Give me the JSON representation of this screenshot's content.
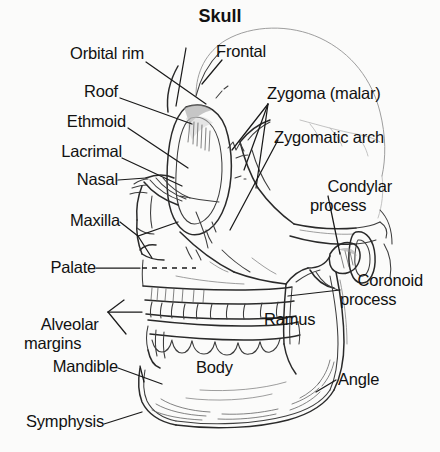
{
  "figure": {
    "title": "Skull",
    "type": "anatomical-diagram",
    "background_color": "#fbfbfa",
    "ink_color": "#2a2a2a"
  },
  "labels": {
    "orbital_rim": "Orbital rim",
    "frontal": "Frontal",
    "roof": "Roof",
    "zygoma_malar": "Zygoma (malar)",
    "ethmoid": "Ethmoid",
    "zygomatic_arch": "Zygomatic arch",
    "lacrimal": "Lacrimal",
    "condylar_process": "Condylar\nprocess",
    "nasal": "Nasal",
    "maxilla": "Maxilla",
    "palate": "Palate",
    "coronoid_process": "Coronoid\nprocess",
    "alveolar_margins": "Alveolar\nmargins",
    "ramus": "Ramus",
    "mandible": "Mandible",
    "body": "Body",
    "angle": "Angle",
    "symphysis": "Symphysis"
  },
  "label_list": [
    "Orbital rim",
    "Frontal",
    "Roof",
    "Zygoma (malar)",
    "Ethmoid",
    "Zygomatic arch",
    "Lacrimal",
    "Condylar process",
    "Nasal",
    "Maxilla",
    "Palate",
    "Coronoid process",
    "Alveolar margins",
    "Ramus",
    "Mandible",
    "Body",
    "Angle",
    "Symphysis"
  ]
}
